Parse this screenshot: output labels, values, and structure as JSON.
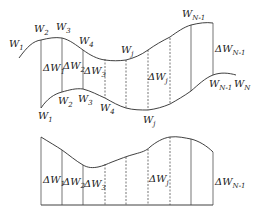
{
  "top_diagram": {
    "upper_labels": [
      {
        "id": "w1",
        "base": "W",
        "sub": "1"
      },
      {
        "id": "w2",
        "base": "W",
        "sub": "2"
      },
      {
        "id": "w3",
        "base": "W",
        "sub": "3"
      },
      {
        "id": "w4",
        "base": "W",
        "sub": "4"
      },
      {
        "id": "wj",
        "base": "W",
        "sub": "j"
      },
      {
        "id": "wn1",
        "base": "W",
        "sub": "N-1"
      }
    ],
    "lower_labels": [
      {
        "id": "w1",
        "base": "W",
        "sub": "1"
      },
      {
        "id": "w2",
        "base": "W",
        "sub": "2"
      },
      {
        "id": "w3",
        "base": "W",
        "sub": "3"
      },
      {
        "id": "w4",
        "base": "W",
        "sub": "4"
      },
      {
        "id": "wj",
        "base": "W",
        "sub": "j"
      },
      {
        "id": "wn1",
        "base": "W",
        "sub": "N-1"
      },
      {
        "id": "wn",
        "base": "W",
        "sub": "N"
      }
    ],
    "delta_labels": [
      {
        "id": "dw1",
        "base": "ΔW",
        "sub": "1"
      },
      {
        "id": "dw2",
        "base": "ΔW",
        "sub": "2"
      },
      {
        "id": "dw3",
        "base": "ΔW",
        "sub": "3"
      },
      {
        "id": "dwj",
        "base": "ΔW",
        "sub": "j"
      },
      {
        "id": "dwn1",
        "base": "ΔW",
        "sub": "N-1"
      }
    ]
  },
  "bottom_diagram": {
    "delta_labels": [
      {
        "id": "dw1",
        "base": "ΔW",
        "sub": "1"
      },
      {
        "id": "dw2",
        "base": "ΔW",
        "sub": "2"
      },
      {
        "id": "dw3",
        "base": "ΔW",
        "sub": "3"
      },
      {
        "id": "dwj",
        "base": "ΔW",
        "sub": "j"
      },
      {
        "id": "dwn1",
        "base": "ΔW",
        "sub": "N-1"
      }
    ]
  }
}
